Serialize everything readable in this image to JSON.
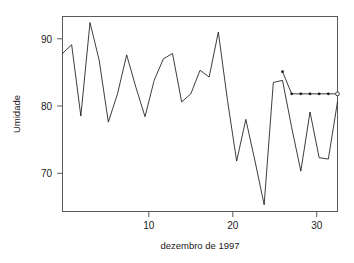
{
  "chart_data": {
    "type": "line",
    "title": "",
    "xlabel": "dezembro  de 1997",
    "ylabel": "Umidade",
    "xlim": [
      1,
      31
    ],
    "ylim": [
      63.5,
      92.5
    ],
    "grid": false,
    "legend": null,
    "xticks": [
      10,
      20,
      30
    ],
    "xtick_labels": [
      "10",
      "20",
      "30"
    ],
    "yticks": [
      70,
      80,
      90
    ],
    "ytick_labels": [
      "70",
      "80",
      "90"
    ],
    "x": [
      1,
      2,
      3,
      4,
      5,
      6,
      7,
      8,
      9,
      10,
      11,
      12,
      13,
      14,
      15,
      16,
      17,
      18,
      19,
      20,
      21,
      22,
      23,
      24,
      25,
      26,
      27,
      28,
      29,
      30,
      31
    ],
    "series": [
      {
        "name": "Umidade observada",
        "style": "line",
        "color": "#1a1a1a",
        "values": [
          87.0,
          88.3,
          77.7,
          91.6,
          86.0,
          76.8,
          81.0,
          86.8,
          82.0,
          77.6,
          83.0,
          86.2,
          87.0,
          79.8,
          81.0,
          84.5,
          83.5,
          90.2,
          80.0,
          71.0,
          77.2,
          71.0,
          64.5,
          82.7,
          83.0,
          76.0,
          69.5,
          78.3,
          71.5,
          71.3,
          79.8
        ]
      },
      {
        "name": "Previsao",
        "style": "line-with-points",
        "color": "#1a1a1a",
        "x": [
          25,
          26,
          27,
          28,
          29,
          30,
          31
        ],
        "values": [
          84.3,
          81.0,
          81.0,
          81.0,
          81.0,
          81.0,
          81.0
        ],
        "marker_filled_count": 6,
        "marker_last": "open-circle"
      }
    ],
    "annotations": []
  },
  "axes": {
    "y_label": "Umidade",
    "x_label": "dezembro  de 1997",
    "y_tick_90": "90",
    "y_tick_80": "80",
    "y_tick_70": "70",
    "x_tick_10": "10",
    "x_tick_20": "20",
    "x_tick_30": "30"
  }
}
